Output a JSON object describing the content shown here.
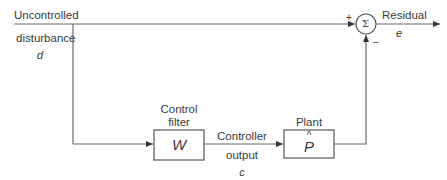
{
  "diagram": {
    "type": "block-diagram",
    "nodes": [
      {
        "id": "control_filter",
        "title_lines": [
          "Control",
          "filter"
        ],
        "symbol": "W"
      },
      {
        "id": "plant",
        "title": "Plant",
        "symbol": "P",
        "symbol_accent": "^"
      },
      {
        "id": "summing_junction",
        "symbol": "Σ",
        "plus_sign": "+",
        "minus_sign": "−"
      }
    ],
    "inputs": {
      "disturbance": {
        "lines": [
          "Uncontrolled",
          "disturbance"
        ],
        "symbol": "d"
      }
    },
    "signals": {
      "controller_output": {
        "lines": [
          "Controller",
          "output"
        ],
        "symbol": "c"
      },
      "residual": {
        "label": "Residual",
        "symbol": "e"
      }
    },
    "edges": [
      {
        "from": "disturbance",
        "to": "summing_junction",
        "sign": "+"
      },
      {
        "from": "disturbance",
        "to": "control_filter"
      },
      {
        "from": "control_filter",
        "to": "plant",
        "label": "Controller output c"
      },
      {
        "from": "plant",
        "to": "summing_junction",
        "sign": "−"
      },
      {
        "from": "summing_junction",
        "to": "output",
        "label": "Residual e"
      }
    ],
    "colors": {
      "line": "#6b6b6b",
      "text": "#3a3a3a",
      "background": "#ffffff"
    }
  }
}
